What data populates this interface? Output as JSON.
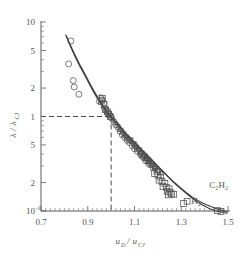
{
  "chart_data": {
    "type": "scatter",
    "title": "",
    "subtitle": "",
    "xlabel": "u_D / u_CJ",
    "xlabel_parts": {
      "main1": "u",
      "sub1": "D",
      "slash": "/",
      "main2": "u",
      "sub2": "CJ"
    },
    "ylabel": "λ / λ_CJ",
    "ylabel_parts": {
      "main1": "λ",
      "slash": "/",
      "main2": "λ",
      "sub2": "CJ"
    },
    "xlim": [
      0.7,
      1.5
    ],
    "ylim": [
      0.1,
      10
    ],
    "xscale": "linear",
    "yscale": "log",
    "grid": false,
    "legend_position": "inline-annotations",
    "xticks": [
      0.7,
      0.9,
      1.1,
      1.3,
      1.5
    ],
    "xtick_labels": [
      "0.7",
      "0.9",
      "1.1",
      "1.3",
      "1.5"
    ],
    "xticks_minor_step": 0.02,
    "yticks": [
      10,
      5,
      2,
      1,
      0.5,
      0.2,
      0.1
    ],
    "ytick_labels": [
      "10",
      "5",
      "2",
      "1",
      "5",
      "2",
      "10"
    ],
    "ytick_label_top_exponent": "",
    "ytick_label_bottom_exponent": "-1",
    "reference_lines": [
      {
        "orientation": "horizontal",
        "value": 1.0,
        "style": "dashed",
        "from_x": 0.7,
        "to_x": 1.0
      },
      {
        "orientation": "vertical",
        "value": 1.0,
        "style": "dashed",
        "from_y": 0.1,
        "to_y": 1.0
      }
    ],
    "annotations": [
      {
        "text": "C2H2",
        "display": "C₂H₂",
        "x": 1.42,
        "y": 0.175,
        "marker": "none"
      },
      {
        "text": "H2",
        "display": "H₂",
        "x": 1.325,
        "y": 0.122,
        "marker": "square"
      }
    ],
    "series": [
      {
        "name": "model-curve-C2H2",
        "type": "line",
        "style": "solid",
        "points": [
          [
            0.808,
            7.1
          ],
          [
            0.825,
            5.6
          ],
          [
            0.845,
            4.35
          ],
          [
            0.865,
            3.45
          ],
          [
            0.885,
            2.8
          ],
          [
            0.905,
            2.25
          ],
          [
            0.925,
            1.82
          ],
          [
            0.945,
            1.5
          ],
          [
            0.965,
            1.26
          ],
          [
            0.985,
            1.09
          ],
          [
            1.005,
            0.945
          ],
          [
            1.025,
            0.83
          ],
          [
            1.045,
            0.73
          ],
          [
            1.065,
            0.645
          ],
          [
            1.085,
            0.575
          ],
          [
            1.105,
            0.512
          ],
          [
            1.125,
            0.455
          ],
          [
            1.145,
            0.405
          ],
          [
            1.165,
            0.36
          ],
          [
            1.185,
            0.322
          ],
          [
            1.205,
            0.287
          ],
          [
            1.225,
            0.256
          ],
          [
            1.245,
            0.228
          ],
          [
            1.265,
            0.204
          ],
          [
            1.285,
            0.184
          ],
          [
            1.305,
            0.166
          ],
          [
            1.325,
            0.151
          ],
          [
            1.345,
            0.138
          ],
          [
            1.365,
            0.127
          ],
          [
            1.385,
            0.118
          ],
          [
            1.405,
            0.111
          ],
          [
            1.425,
            0.105
          ],
          [
            1.445,
            0.101
          ],
          [
            1.465,
            0.098
          ],
          [
            1.485,
            0.096
          ],
          [
            1.497,
            0.095
          ]
        ]
      },
      {
        "name": "model-curve-H2",
        "type": "line",
        "style": "solid",
        "points": [
          [
            0.806,
            7.3
          ],
          [
            0.825,
            5.75
          ],
          [
            0.845,
            4.5
          ],
          [
            0.865,
            3.58
          ],
          [
            0.885,
            2.9
          ],
          [
            0.905,
            2.33
          ],
          [
            0.925,
            1.89
          ],
          [
            0.945,
            1.56
          ],
          [
            0.965,
            1.31
          ],
          [
            0.985,
            1.12
          ],
          [
            1.005,
            0.97
          ],
          [
            1.025,
            0.85
          ],
          [
            1.045,
            0.748
          ],
          [
            1.065,
            0.66
          ],
          [
            1.085,
            0.587
          ],
          [
            1.105,
            0.522
          ],
          [
            1.125,
            0.464
          ],
          [
            1.145,
            0.412
          ],
          [
            1.165,
            0.366
          ],
          [
            1.185,
            0.326
          ],
          [
            1.205,
            0.29
          ],
          [
            1.225,
            0.258
          ],
          [
            1.245,
            0.23
          ],
          [
            1.265,
            0.206
          ],
          [
            1.285,
            0.186
          ],
          [
            1.305,
            0.169
          ],
          [
            1.325,
            0.154
          ],
          [
            1.345,
            0.142
          ],
          [
            1.365,
            0.132
          ],
          [
            1.385,
            0.124
          ],
          [
            1.405,
            0.117
          ],
          [
            1.425,
            0.112
          ],
          [
            1.445,
            0.107
          ],
          [
            1.465,
            0.103
          ],
          [
            1.485,
            0.1
          ],
          [
            1.497,
            0.098
          ]
        ]
      },
      {
        "name": "circle-data",
        "type": "scatter",
        "marker": "circle",
        "points": [
          [
            0.828,
            6.3
          ],
          [
            0.818,
            3.6
          ],
          [
            0.838,
            2.4
          ],
          [
            0.842,
            2.05
          ],
          [
            0.862,
            1.72
          ],
          [
            0.955,
            1.58
          ],
          [
            0.962,
            1.5
          ],
          [
            0.95,
            1.44
          ],
          [
            0.968,
            1.38
          ],
          [
            0.972,
            1.22
          ],
          [
            0.978,
            1.16
          ],
          [
            0.985,
            1.1
          ],
          [
            0.992,
            1.04
          ],
          [
            0.998,
            1.0
          ],
          [
            1.002,
            0.96
          ],
          [
            1.012,
            0.88
          ],
          [
            1.02,
            0.82
          ],
          [
            1.028,
            0.78
          ],
          [
            1.038,
            0.7
          ],
          [
            1.048,
            0.64
          ],
          [
            1.058,
            0.6
          ],
          [
            1.068,
            0.56
          ],
          [
            1.078,
            0.53
          ],
          [
            1.09,
            0.49
          ],
          [
            1.1,
            0.455
          ],
          [
            1.112,
            0.43
          ],
          [
            1.125,
            0.4
          ],
          [
            1.135,
            0.375
          ],
          [
            1.148,
            0.34
          ],
          [
            1.16,
            0.32
          ]
        ]
      },
      {
        "name": "triangle-down-data",
        "type": "scatter",
        "marker": "triangle-down",
        "points": [
          [
            1.082,
            0.56
          ],
          [
            1.095,
            0.51
          ],
          [
            1.105,
            0.47
          ],
          [
            1.118,
            0.44
          ],
          [
            1.128,
            0.41
          ],
          [
            1.14,
            0.382
          ],
          [
            1.152,
            0.352
          ],
          [
            1.165,
            0.325
          ],
          [
            1.178,
            0.3
          ],
          [
            1.19,
            0.278
          ],
          [
            1.205,
            0.258
          ],
          [
            1.098,
            0.492
          ],
          [
            1.062,
            0.602
          ],
          [
            1.072,
            0.568
          ]
        ]
      },
      {
        "name": "plus-data",
        "type": "scatter",
        "marker": "plus",
        "points": [
          [
            1.008,
            0.93
          ],
          [
            1.016,
            0.87
          ],
          [
            1.024,
            0.82
          ],
          [
            1.034,
            0.76
          ],
          [
            1.042,
            0.715
          ],
          [
            1.052,
            0.672
          ],
          [
            1.06,
            0.63
          ],
          [
            1.07,
            0.59
          ],
          [
            1.08,
            0.555
          ],
          [
            1.09,
            0.52
          ],
          [
            1.1,
            0.488
          ],
          [
            1.11,
            0.458
          ],
          [
            1.12,
            0.43
          ],
          [
            1.13,
            0.402
          ],
          [
            1.142,
            0.375
          ],
          [
            1.154,
            0.348
          ],
          [
            1.166,
            0.322
          ],
          [
            1.178,
            0.3
          ],
          [
            1.19,
            0.28
          ]
        ]
      },
      {
        "name": "square-data",
        "type": "scatter",
        "marker": "square",
        "points": [
          [
            0.962,
            1.55
          ],
          [
            0.958,
            1.46
          ],
          [
            0.97,
            1.34
          ],
          [
            0.976,
            1.18
          ],
          [
            0.984,
            1.12
          ],
          [
            0.99,
            1.06
          ],
          [
            0.996,
            1.0
          ],
          [
            1.132,
            0.392
          ],
          [
            1.145,
            0.368
          ],
          [
            1.158,
            0.34
          ],
          [
            1.17,
            0.312
          ],
          [
            1.182,
            0.288
          ],
          [
            1.196,
            0.264
          ],
          [
            1.186,
            0.248
          ],
          [
            1.2,
            0.24
          ],
          [
            1.212,
            0.228
          ],
          [
            1.205,
            0.212
          ],
          [
            1.218,
            0.205
          ],
          [
            1.23,
            0.196
          ],
          [
            1.222,
            0.182
          ],
          [
            1.236,
            0.178
          ],
          [
            1.248,
            0.172
          ],
          [
            1.24,
            0.162
          ],
          [
            1.252,
            0.158
          ],
          [
            1.258,
            0.152
          ],
          [
            1.268,
            0.15
          ],
          [
            1.245,
            0.148
          ],
          [
            1.31,
            0.12
          ],
          [
            1.455,
            0.101
          ],
          [
            1.47,
            0.099
          ]
        ]
      },
      {
        "name": "triangle-up-data",
        "type": "scatter",
        "marker": "triangle-up",
        "points": [
          [
            1.04,
            0.735
          ],
          [
            1.05,
            0.69
          ],
          [
            1.058,
            0.648
          ],
          [
            1.128,
            0.415
          ],
          [
            1.14,
            0.39
          ],
          [
            1.152,
            0.362
          ],
          [
            1.164,
            0.336
          ],
          [
            1.176,
            0.312
          ],
          [
            1.188,
            0.292
          ],
          [
            1.2,
            0.272
          ],
          [
            1.212,
            0.255
          ]
        ]
      },
      {
        "name": "x-cross-data",
        "type": "scatter",
        "marker": "x-cross",
        "points": [
          [
            1.03,
            0.79
          ],
          [
            1.044,
            0.722
          ],
          [
            1.056,
            0.66
          ],
          [
            1.068,
            0.608
          ],
          [
            1.082,
            0.552
          ],
          [
            1.096,
            0.505
          ],
          [
            1.108,
            0.468
          ],
          [
            1.122,
            0.432
          ],
          [
            1.136,
            0.398
          ],
          [
            1.15,
            0.362
          ],
          [
            1.164,
            0.33
          ]
        ]
      }
    ]
  },
  "corner": {
    "mark": ""
  }
}
